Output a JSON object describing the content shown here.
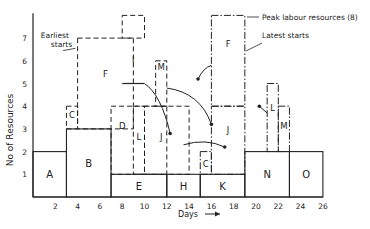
{
  "chart_data": {
    "type": "bar",
    "subtype": "resource-histogram",
    "title": "",
    "xlabel": "Days",
    "ylabel": "No of Resources",
    "xlim": [
      0,
      26
    ],
    "ylim": [
      0,
      8
    ],
    "x_ticks": [
      2,
      4,
      6,
      8,
      10,
      12,
      14,
      16,
      18,
      20,
      22,
      24,
      26
    ],
    "y_ticks": [
      1,
      2,
      3,
      4,
      5,
      6,
      7
    ],
    "grid": false,
    "base_activities": [
      {
        "name": "A",
        "start": 0,
        "end": 3,
        "bottom": 0,
        "top": 2
      },
      {
        "name": "B",
        "start": 3,
        "end": 7,
        "bottom": 0,
        "top": 3
      },
      {
        "name": "E",
        "start": 7,
        "end": 12,
        "bottom": 0,
        "top": 1
      },
      {
        "name": "H",
        "start": 12,
        "end": 15,
        "bottom": 0,
        "top": 1
      },
      {
        "name": "K",
        "start": 15,
        "end": 19,
        "bottom": 0,
        "top": 1
      },
      {
        "name": "N",
        "start": 19,
        "end": 23,
        "bottom": 0,
        "top": 2
      },
      {
        "name": "O",
        "start": 23,
        "end": 26,
        "bottom": 0,
        "top": 2
      }
    ],
    "earliest_starts": [
      {
        "name": "C",
        "start": 3,
        "end": 4,
        "bottom": 3,
        "top": 4
      },
      {
        "name": "F",
        "start": 4,
        "end": 9,
        "bottom": 3,
        "top": 7
      },
      {
        "name": "I",
        "start": 9,
        "end": 9,
        "bottom": 0,
        "top": 0,
        "label_only": true
      },
      {
        "name": "D",
        "start": 7,
        "end": 12,
        "bottom": 1,
        "top": 4
      },
      {
        "name": "L",
        "start": 9,
        "end": 10,
        "bottom": 1,
        "top": 4
      },
      {
        "name": "J",
        "start": 10,
        "end": 14,
        "bottom": 1,
        "top": 4
      },
      {
        "name": "M",
        "start": 11,
        "end": 12,
        "bottom": 4,
        "top": 6
      },
      {
        "name": "top",
        "start": 8,
        "end": 10,
        "bottom": 7,
        "top": 8
      }
    ],
    "latest_starts": [
      {
        "name": "F",
        "start": 16,
        "end": 19,
        "bottom": 4,
        "top": 8
      },
      {
        "name": "J",
        "start": 16,
        "end": 19,
        "bottom": 1,
        "top": 4
      },
      {
        "name": "C",
        "start": 15,
        "end": 16,
        "bottom": 1,
        "top": 2
      },
      {
        "name": "L",
        "start": 21,
        "end": 22,
        "bottom": 2,
        "top": 5
      },
      {
        "name": "M",
        "start": 22,
        "end": 23,
        "bottom": 2,
        "top": 4
      }
    ],
    "solid_marks": [
      {
        "name": "I",
        "start": 8,
        "end": 10,
        "level": 5
      }
    ],
    "annotations": [
      {
        "text": "Earliest starts",
        "position": "top-left"
      },
      {
        "text": "Peak labour resources (8)",
        "position": "top-right"
      },
      {
        "text": "Latest starts",
        "position": "top-right"
      }
    ]
  }
}
